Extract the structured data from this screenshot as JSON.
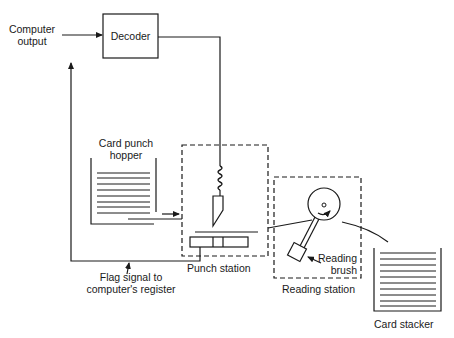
{
  "diagram": {
    "type": "punched-card output system block diagram",
    "labels": {
      "computer_output_line1": "Computer",
      "computer_output_line2": "output",
      "decoder": "Decoder",
      "card_punch_hopper_line1": "Card punch",
      "card_punch_hopper_line2": "hopper",
      "flag_signal_line1": "Flag signal to",
      "flag_signal_line2": "computer's register",
      "punch_station": "Punch station",
      "reading_brush_line1": "Reading",
      "reading_brush_line2": "brush",
      "reading_station": "Reading station",
      "card_stacker": "Card stacker"
    },
    "nodes": [
      {
        "id": "computer-output",
        "label": "Computer output",
        "shape": "text"
      },
      {
        "id": "decoder",
        "label": "Decoder",
        "shape": "box"
      },
      {
        "id": "card-punch-hopper",
        "label": "Card punch hopper",
        "shape": "card-stack"
      },
      {
        "id": "punch-station",
        "label": "Punch station",
        "shape": "dashed-box"
      },
      {
        "id": "reading-station",
        "label": "Reading station",
        "shape": "dashed-box"
      },
      {
        "id": "reading-brush",
        "label": "Reading brush",
        "shape": "component"
      },
      {
        "id": "card-stacker",
        "label": "Card stacker",
        "shape": "card-stack"
      }
    ],
    "edges": [
      {
        "from": "computer-output",
        "to": "decoder",
        "arrow": true
      },
      {
        "from": "decoder",
        "to": "punch-station",
        "arrow": false
      },
      {
        "from": "card-punch-hopper",
        "to": "punch-station",
        "arrow": true
      },
      {
        "from": "punch-station",
        "to": "computer-output",
        "label": "Flag signal to computer's register",
        "arrow": true
      },
      {
        "from": "punch-station",
        "to": "reading-station",
        "arrow": false
      },
      {
        "from": "reading-station",
        "to": "card-stacker",
        "arrow": false
      }
    ],
    "colors": {
      "line": "#1a1a1a",
      "background": "#ffffff"
    }
  }
}
